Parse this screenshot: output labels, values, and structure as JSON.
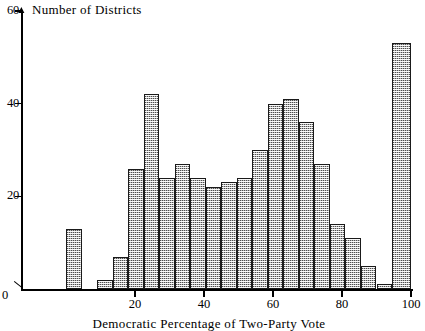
{
  "figure": {
    "type": "histogram",
    "background_color": "#ffffff",
    "axis_color": "#000000",
    "bar_fill_color": "#b8b8b8",
    "bar_edge_color": "#1a1a1a"
  },
  "yaxis": {
    "title": "Number of Districts",
    "ticks": [
      {
        "value": 60,
        "label": "60"
      },
      {
        "value": 40,
        "label": "40"
      },
      {
        "value": 20,
        "label": "20"
      }
    ],
    "origin_label": "0",
    "min": 0,
    "max": 60
  },
  "xaxis": {
    "title": "Democratic Percentage of Two-Party Vote",
    "ticks": [
      {
        "value": 20,
        "label": "20"
      },
      {
        "value": 40,
        "label": "40"
      },
      {
        "value": 60,
        "label": "60"
      },
      {
        "value": 80,
        "label": "80"
      },
      {
        "value": 100,
        "label": "100"
      }
    ],
    "min": 0,
    "max": 100
  },
  "chart_data": {
    "type": "bar",
    "title": "",
    "xlabel": "Democratic Percentage of Two-Party Vote",
    "ylabel": "Number of Districts",
    "xlim": [
      0,
      100
    ],
    "ylim": [
      0,
      60
    ],
    "grid": false,
    "legend": "none",
    "bin_width": 4.5,
    "bin_starts": [
      0.0,
      4.5,
      9.0,
      13.5,
      18.0,
      22.5,
      27.0,
      31.5,
      36.0,
      40.5,
      45.0,
      49.5,
      54.0,
      58.5,
      63.0,
      67.5,
      72.0,
      76.5,
      81.0,
      85.5,
      90.0,
      94.5
    ],
    "categories": [
      "0-4.5",
      "4.5-9",
      "9-13.5",
      "13.5-18",
      "18-22.5",
      "22.5-27",
      "27-31.5",
      "31.5-36",
      "36-40.5",
      "40.5-45",
      "45-49.5",
      "49.5-54",
      "54-58.5",
      "58.5-63",
      "63-67.5",
      "67.5-72",
      "72-76.5",
      "76.5-81",
      "81-85.5",
      "85.5-90",
      "90-94.5",
      "94.5-100"
    ],
    "values": [
      13,
      0,
      2,
      7,
      26,
      42,
      24,
      27,
      24,
      22,
      23,
      24,
      30,
      40,
      41,
      36,
      27,
      14,
      11,
      5,
      1,
      53
    ]
  }
}
